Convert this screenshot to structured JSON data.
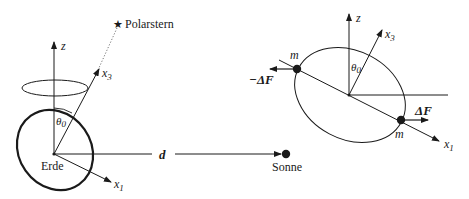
{
  "left_diagram": {
    "star_label": "Polarstern",
    "star_icon": "★",
    "z_axis": "z",
    "x3_axis": "x",
    "x3_sub": "3",
    "x1_axis": "x",
    "x1_sub": "1",
    "angle": "θ",
    "angle_sub": "0",
    "earth_label": "Erde",
    "distance_label": "d",
    "sun_label": "Sonne"
  },
  "right_diagram": {
    "z_axis": "z",
    "x3_axis": "x",
    "x3_sub": "3",
    "x1_axis": "x",
    "x1_sub": "1",
    "angle": "θ",
    "angle_sub": "0",
    "mass_top": "m",
    "mass_bottom": "m",
    "force_neg": "−ΔF",
    "force_pos": "ΔF"
  },
  "colors": {
    "ink": "#1a1a1a",
    "dotted": "#666666"
  }
}
